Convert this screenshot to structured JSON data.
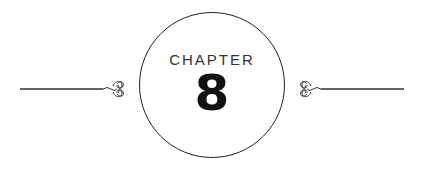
{
  "heading": {
    "label": "CHAPTER",
    "number": "8"
  },
  "ornaments": {
    "left": "flourish-icon",
    "right": "flourish-icon"
  },
  "colors": {
    "line": "#222222",
    "text": "#333333",
    "number": "#111111"
  }
}
